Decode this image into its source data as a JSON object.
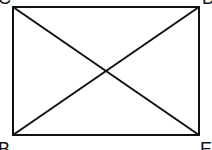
{
  "diagram": {
    "type": "rectangle-with-diagonals",
    "stroke_color": "#111111",
    "background": "#ffffff",
    "vertices": {
      "top_left": {
        "label": "C",
        "x": 13,
        "y": 7
      },
      "top_right": {
        "label": "D",
        "x": 199,
        "y": 7
      },
      "bottom_left": {
        "label": "B",
        "x": 13,
        "y": 135
      },
      "bottom_right": {
        "label": "E",
        "x": 199,
        "y": 135
      }
    },
    "diagonals": [
      "C-E",
      "D-B"
    ]
  }
}
